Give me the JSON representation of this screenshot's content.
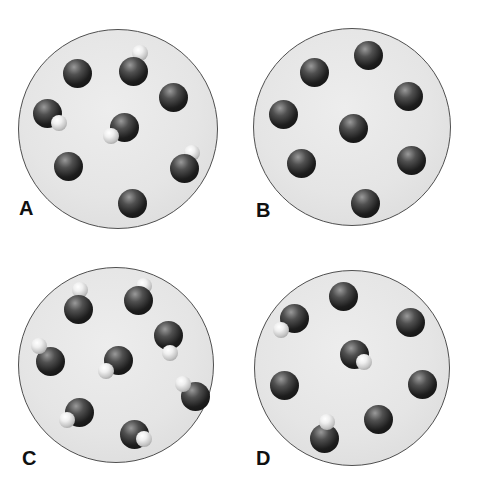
{
  "figure": {
    "background": "#ffffff",
    "panel_size": {
      "w": 238,
      "h": 247
    },
    "sphere_style": {
      "dark_diameter": 29,
      "white_diameter": 16,
      "dark_base_color": "#0c0c0c",
      "dark_highlight_color": "#9a9a9a",
      "white_base_color": "#8d8d8d",
      "white_highlight_color": "#ffffff"
    },
    "vessel_style": {
      "fill": "#e5e5e5",
      "border_color": "#4f4f4f"
    },
    "panels": [
      {
        "label": "A",
        "pos": {
          "x": 0,
          "y": 0
        },
        "circle": {
          "cx": 118,
          "cy": 129,
          "r": 100
        },
        "label_pos": {
          "x": 19,
          "y": 198
        },
        "dark_count": 8,
        "white_count": 4,
        "molecules": [
          {
            "x": 77,
            "y": 73
          },
          {
            "x": 133,
            "y": 71,
            "white": {
              "dx": 7,
              "dy": -18,
              "z": "behind"
            }
          },
          {
            "x": 173,
            "y": 97
          },
          {
            "x": 47,
            "y": 113,
            "white": {
              "dx": 12,
              "dy": 10,
              "z": "front"
            }
          },
          {
            "x": 124,
            "y": 127,
            "white": {
              "dx": -13,
              "dy": 9,
              "z": "front"
            }
          },
          {
            "x": 68,
            "y": 166
          },
          {
            "x": 184,
            "y": 168,
            "white": {
              "dx": 8,
              "dy": -15,
              "z": "behind"
            }
          },
          {
            "x": 132,
            "y": 203
          }
        ]
      },
      {
        "label": "B",
        "pos": {
          "x": 237,
          "y": 0
        },
        "circle": {
          "cx": 115,
          "cy": 127,
          "r": 99
        },
        "label_pos": {
          "x": 19,
          "y": 200
        },
        "dark_count": 8,
        "white_count": 0,
        "molecules": [
          {
            "x": 131,
            "y": 55
          },
          {
            "x": 77,
            "y": 72
          },
          {
            "x": 171,
            "y": 96
          },
          {
            "x": 46,
            "y": 114
          },
          {
            "x": 116,
            "y": 128
          },
          {
            "x": 64,
            "y": 163
          },
          {
            "x": 174,
            "y": 160
          },
          {
            "x": 128,
            "y": 203
          }
        ]
      },
      {
        "label": "C",
        "pos": {
          "x": 0,
          "y": 247
        },
        "circle": {
          "cx": 116,
          "cy": 118,
          "r": 98
        },
        "label_pos": {
          "x": 22,
          "y": 201
        },
        "dark_count": 8,
        "white_count": 8,
        "molecules": [
          {
            "x": 78,
            "y": 62,
            "white": {
              "dx": 2,
              "dy": -19,
              "z": "behind"
            }
          },
          {
            "x": 138,
            "y": 53,
            "white": {
              "dx": 6,
              "dy": -14,
              "z": "behind"
            }
          },
          {
            "x": 168,
            "y": 88,
            "white": {
              "dx": 2,
              "dy": 18,
              "z": "front"
            }
          },
          {
            "x": 50,
            "y": 114,
            "white": {
              "dx": -11,
              "dy": -15,
              "z": "front"
            }
          },
          {
            "x": 118,
            "y": 113,
            "white": {
              "dx": -12,
              "dy": 11,
              "z": "front"
            }
          },
          {
            "x": 195,
            "y": 149,
            "white": {
              "dx": -12,
              "dy": -12,
              "z": "front"
            }
          },
          {
            "x": 79,
            "y": 165,
            "white": {
              "dx": -12,
              "dy": 8,
              "z": "front"
            }
          },
          {
            "x": 134,
            "y": 187,
            "white": {
              "dx": 10,
              "dy": 5,
              "z": "front"
            }
          }
        ]
      },
      {
        "label": "D",
        "pos": {
          "x": 237,
          "y": 247
        },
        "circle": {
          "cx": 115,
          "cy": 121,
          "r": 98
        },
        "label_pos": {
          "x": 19,
          "y": 201
        },
        "dark_count": 8,
        "white_count": 3,
        "molecules": [
          {
            "x": 106,
            "y": 49
          },
          {
            "x": 57,
            "y": 71,
            "white": {
              "dx": -13,
              "dy": 12,
              "z": "front"
            }
          },
          {
            "x": 173,
            "y": 75
          },
          {
            "x": 117,
            "y": 107,
            "white": {
              "dx": 10,
              "dy": 8,
              "z": "front"
            }
          },
          {
            "x": 47,
            "y": 138
          },
          {
            "x": 185,
            "y": 137
          },
          {
            "x": 141,
            "y": 172
          },
          {
            "x": 87,
            "y": 191,
            "white": {
              "dx": 3,
              "dy": -16,
              "z": "front"
            }
          }
        ]
      }
    ]
  }
}
